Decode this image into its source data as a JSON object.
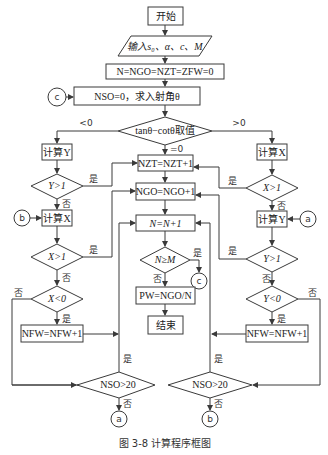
{
  "figure": {
    "caption": "图 3-8    计算程序框图"
  },
  "nodes": {
    "start": "开始",
    "input": "输入s₀、α、c、M",
    "init": "N=NGO=NZT=ZFW=0",
    "nso_init": "NSO=0，求入射角θ",
    "decision_main": "tanθ−cotθ取值",
    "calc_y_left": "计算Y",
    "y_gt1_left": "Y>1",
    "calc_x_left": "计算X",
    "x_gt1_left": "X>1",
    "x_lt0": "X<0",
    "nfw_left": "NFW=NFW+1",
    "nso_left": "NSO>20",
    "nzt": "NZT=NZT+1",
    "ngo": "NGO=NGO+1",
    "n_inc": "N=N+1",
    "n_ge_m": "N≥M",
    "pw": "PW=NGO/N",
    "end": "结束",
    "calc_x_right": "计算X",
    "x_gt1_right": "X>1",
    "calc_y_right": "计算Y",
    "y_gt1_right": "Y>1",
    "y_lt0": "Y<0",
    "nfw_right": "NFW=NFW+1",
    "nso_right": "NSO>20"
  },
  "connectors": {
    "a": "a",
    "b": "b",
    "c": "c"
  },
  "labels": {
    "lt0": "<0",
    "eq0": "=0",
    "gt0": ">0",
    "yes": "是",
    "no": "否"
  }
}
